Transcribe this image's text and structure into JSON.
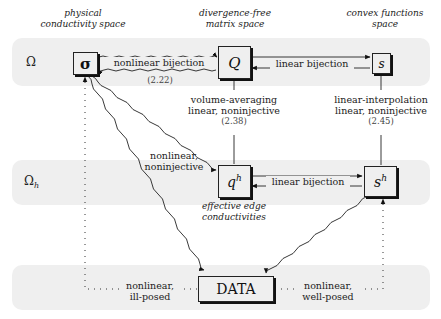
{
  "headers": {
    "physical": [
      "physical",
      "conductivity space"
    ],
    "divergence_free": [
      "divergence-free",
      "matrix space"
    ],
    "convex": [
      "convex functions",
      "space"
    ]
  },
  "rows": {
    "omega": "Ω",
    "omega_h": "Ω",
    "omega_h_sub": "h"
  },
  "nodes": {
    "sigma": "σ",
    "Q": "Q",
    "s": "s",
    "qh": "q",
    "qh_sup": "h",
    "sh": "s",
    "sh_sup": "h",
    "data": "DATA"
  },
  "edges": {
    "sigma_Q": {
      "label": "nonlinear bijection",
      "eq": "(2.22)"
    },
    "Q_s": {
      "label": "linear bijection"
    },
    "Q_qh": {
      "line1": "volume-averaging",
      "line2": "linear, noninjective",
      "eq": "(2.38)"
    },
    "s_sh": {
      "line1": "linear-interpolation",
      "line2": "linear, noninjective",
      "eq": "(2.45)"
    },
    "qh_sh": {
      "label": "linear bijection"
    },
    "sigma_qh": {
      "line1": "nonlinear,",
      "line2": "noninjective"
    },
    "sigma_data": {
      "line1": "nonlinear,",
      "line2": "ill-posed"
    },
    "sh_data": {
      "line1": "nonlinear,",
      "line2": "well-posed"
    }
  },
  "annotations": {
    "qh_caption": [
      "effective edge",
      "conductivities"
    ]
  },
  "colors": {
    "band": "#efefef",
    "line": "#222222"
  }
}
